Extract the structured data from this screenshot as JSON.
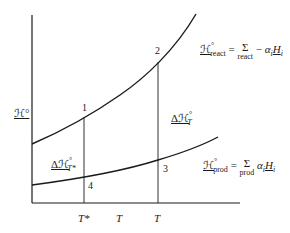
{
  "diagram": {
    "y_axis_label": "ℋ°",
    "x_axis": {
      "tick_labels": [
        "T*",
        "T",
        "T"
      ]
    },
    "points": [
      "1",
      "2",
      "3",
      "4"
    ],
    "curves": {
      "reactants": {
        "lhs_symbol": "ℋ",
        "lhs_sup": "°",
        "lhs_sub": "react",
        "equals": "=",
        "sum": "Σ",
        "sum_sub": "react",
        "minus": "−",
        "coef": "α",
        "coef_sub": "i",
        "term": "H",
        "term_sub": "i"
      },
      "products": {
        "lhs_symbol": "ℋ",
        "lhs_sup": "°",
        "lhs_sub": "prod",
        "equals": "=",
        "sum": "Σ",
        "sum_sub": "prod",
        "coef": "α",
        "coef_sub": "i",
        "term": "H",
        "term_sub": "i"
      }
    },
    "delta_labels": {
      "at_T_star": {
        "prefix": "Δℋ",
        "sup": "°",
        "sub": "T*"
      },
      "at_T": {
        "prefix": "Δℋ",
        "sup": "°",
        "sub": "T"
      }
    },
    "colors": {
      "line": "#1a1a1a",
      "background": "#ffffff"
    }
  }
}
